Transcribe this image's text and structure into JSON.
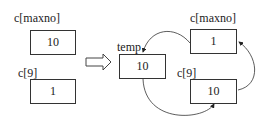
{
  "before": {
    "top": {
      "label": "c[maxno]",
      "value": "10"
    },
    "bottom": {
      "label": "c[9]",
      "value": "1"
    }
  },
  "after": {
    "temp": {
      "label": "temp",
      "value": "10"
    },
    "top": {
      "label": "c[maxno]",
      "value": "1"
    },
    "bottom": {
      "label": "c[9]",
      "value": "10"
    }
  },
  "icons": {
    "transition_arrow": "hollow-right-arrow"
  }
}
